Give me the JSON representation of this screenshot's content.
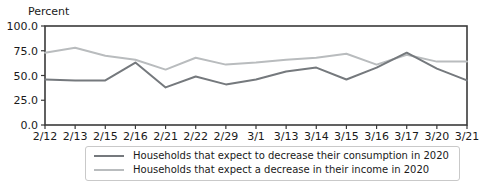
{
  "chart_data": {
    "type": "line",
    "title": "",
    "ylabel": "Percent",
    "xlabel": "",
    "grid": false,
    "legend_position": "bottom",
    "ylim": [
      0,
      100
    ],
    "yticks": [
      0,
      25,
      50,
      75,
      100
    ],
    "ytick_labels": [
      "0.0",
      "25.0",
      "50.0",
      "75.0",
      "100.0"
    ],
    "categories": [
      "2/12",
      "2/13",
      "2/15",
      "2/16",
      "2/21",
      "2/22",
      "2/29",
      "3/1",
      "3/13",
      "3/14",
      "3/15",
      "3/16",
      "3/17",
      "3/20",
      "3/21"
    ],
    "series": [
      {
        "name": "Households that expect to decrease their consumption in 2020",
        "color": "#75797d",
        "values": [
          46,
          45,
          45,
          63,
          38,
          49,
          41,
          46,
          54,
          58,
          46,
          58,
          73,
          57,
          45
        ]
      },
      {
        "name": "Households that expect a decrease in their income in 2020",
        "color": "#b9bcbe",
        "values": [
          73,
          78,
          70,
          66,
          56,
          68,
          61,
          63,
          66,
          68,
          72,
          61,
          71,
          64,
          64
        ]
      }
    ],
    "axis_color": "#3a3a3a"
  }
}
